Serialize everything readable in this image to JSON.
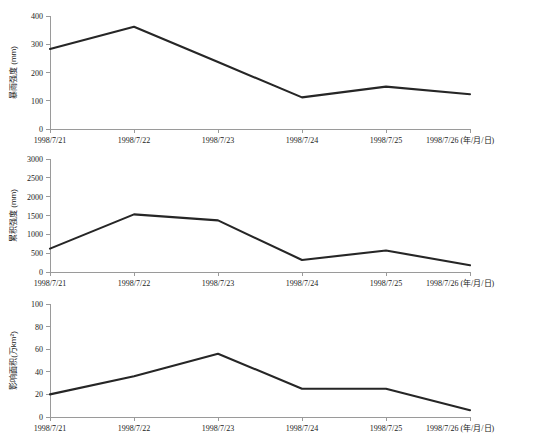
{
  "figure": {
    "background": "#ffffff",
    "line_color": "#262626",
    "axis_color": "#9a9a9a",
    "categories": [
      "1998/7/21",
      "1998/7/22",
      "1998/7/23",
      "1998/7/24",
      "1998/7/25",
      "1998/7/26"
    ],
    "x_unit_suffix": "(年/月/日)"
  },
  "chart_data": [
    {
      "type": "line",
      "title": "",
      "panel_index": 0,
      "categories": [
        "1998/7/21",
        "1998/7/22",
        "1998/7/23",
        "1998/7/24",
        "1998/7/25",
        "1998/7/26"
      ],
      "values": [
        283,
        362,
        237,
        112,
        150,
        123
      ],
      "xlabel": "1998/7/26 (年/月/日)",
      "ylabel": "暴雨强度 (mm)",
      "ylim": [
        0,
        400
      ],
      "yticks": [
        0,
        100,
        200,
        300,
        400
      ],
      "ytick_labels": [
        "0",
        "100",
        "200",
        "300",
        "400"
      ],
      "xtick_labels": [
        "1998/7/21",
        "1998/7/22",
        "1998/7/23",
        "1998/7/24",
        "1998/7/25",
        "1998/7/26 (年/月/日)"
      ],
      "grid": false,
      "legend": "none"
    },
    {
      "type": "line",
      "title": "",
      "panel_index": 1,
      "categories": [
        "1998/7/21",
        "1998/7/22",
        "1998/7/23",
        "1998/7/24",
        "1998/7/25",
        "1998/7/26"
      ],
      "values": [
        620,
        1530,
        1370,
        320,
        570,
        180
      ],
      "xlabel": "1998/7/26 (年/月/日)",
      "ylabel": "累积强度 (mm)",
      "ylim": [
        0,
        3000
      ],
      "yticks": [
        0,
        500,
        1000,
        1500,
        2000,
        2500,
        3000
      ],
      "ytick_labels": [
        "0",
        "500",
        "1000",
        "1500",
        "2000",
        "2500",
        "3000"
      ],
      "xtick_labels": [
        "1998/7/21",
        "1998/7/22",
        "1998/7/23",
        "1998/7/24",
        "1998/7/25",
        "1998/7/26 (年/月/日)"
      ],
      "grid": false,
      "legend": "none"
    },
    {
      "type": "line",
      "title": "",
      "panel_index": 2,
      "categories": [
        "1998/7/21",
        "1998/7/22",
        "1998/7/23",
        "1998/7/24",
        "1998/7/25",
        "1998/7/26"
      ],
      "values": [
        20,
        36,
        56,
        25,
        25,
        6
      ],
      "xlabel": "1998/7/26 (年/月/日)",
      "ylabel": "影响面积(万km²)",
      "ylim": [
        0,
        100
      ],
      "yticks": [
        0,
        20,
        40,
        60,
        80,
        100
      ],
      "ytick_labels": [
        "0",
        "20",
        "40",
        "60",
        "80",
        "100"
      ],
      "xtick_labels": [
        "1998/7/21",
        "1998/7/22",
        "1998/7/23",
        "1998/7/24",
        "1998/7/25",
        "1998/7/26 (年/月/日)"
      ],
      "grid": false,
      "legend": "none"
    }
  ]
}
